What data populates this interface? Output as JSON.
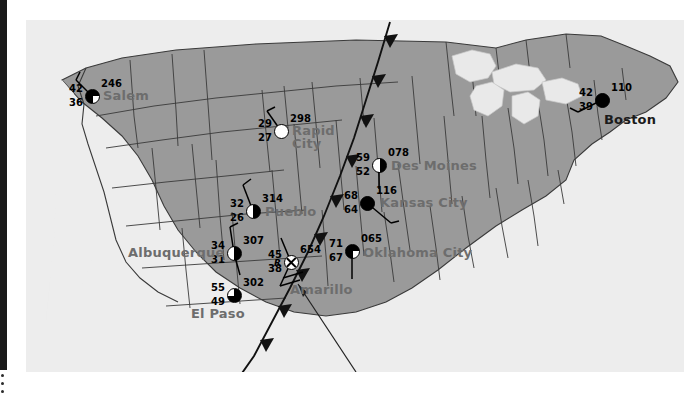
{
  "map": {
    "title": "US Surface Station Plot Map",
    "colors": {
      "land": "#9a9a9a",
      "water": "#e4e4e4",
      "ocean": "#ededed",
      "border": "#3a3a3a",
      "front_line": "#111111",
      "label_gray": "#6d6d6d",
      "label_dark": "#1b1b1b",
      "page_background": "#ffffff",
      "edge_bar": "#1a1a1a"
    },
    "front": {
      "type": "cold-front",
      "symbol": "triangle-barbs",
      "count": 9
    },
    "pointer": {
      "name": "callout-leader-line",
      "direction": "up-left",
      "target": "Amarillo"
    }
  },
  "stations": [
    {
      "id": "salem",
      "city": "Salem",
      "label_color": "gray",
      "temperature": "42",
      "dewpoint": "36",
      "pressure": "246",
      "sky_cover": "three-q",
      "sky_cover_name": "broken-clouds",
      "wind": {
        "has_barb": true,
        "direction_deg": 315,
        "barbs": 1
      },
      "x": 92,
      "y": 96,
      "city_x": 103,
      "city_y": 89
    },
    {
      "id": "rapid-city",
      "city": "Rapid City",
      "city_line1": "Rapid",
      "city_line2": "City",
      "label_color": "gray",
      "temperature": "29",
      "dewpoint": "27",
      "pressure": "298",
      "sky_cover": "clear",
      "sky_cover_name": "clear-sky",
      "wind": {
        "has_barb": true,
        "direction_deg": 340,
        "barbs": 1
      },
      "x": 281,
      "y": 131,
      "city_x": 292,
      "city_y": 124
    },
    {
      "id": "boston",
      "city": "Boston",
      "label_color": "dark",
      "temperature": "42",
      "dewpoint": "39",
      "pressure": "110",
      "sky_cover": "overcast",
      "sky_cover_name": "overcast",
      "wind": {
        "has_barb": true,
        "direction_deg": 215,
        "barbs": 2
      },
      "x": 602,
      "y": 100,
      "city_x": 604,
      "city_y": 113
    },
    {
      "id": "des-moines",
      "city": "Des Moines",
      "label_color": "gray",
      "temperature": "59",
      "dewpoint": "52",
      "pressure": "078",
      "sky_cover": "half",
      "sky_cover_name": "scattered-clouds",
      "wind": {
        "has_barb": true,
        "direction_deg": 180,
        "barbs": 1
      },
      "x": 379,
      "y": 165,
      "city_x": 391,
      "city_y": 159
    },
    {
      "id": "kansas-city",
      "city": "Kansas City",
      "label_color": "gray",
      "temperature": "68",
      "dewpoint": "64",
      "pressure": "116",
      "sky_cover": "overcast",
      "sky_cover_name": "overcast",
      "wind": {
        "has_barb": true,
        "direction_deg": 150,
        "barbs": 1
      },
      "x": 367,
      "y": 203,
      "city_x": 380,
      "city_y": 196
    },
    {
      "id": "pueblo",
      "city": "Pueblo",
      "label_color": "gray",
      "temperature": "32",
      "dewpoint": "26",
      "pressure": "314",
      "sky_cover": "half",
      "sky_cover_name": "scattered-clouds",
      "wind": {
        "has_barb": true,
        "direction_deg": 340,
        "barbs": 1
      },
      "x": 253,
      "y": 211,
      "city_x": 265,
      "city_y": 205
    },
    {
      "id": "albuquerque",
      "city": "Albuquerque",
      "label_color": "gray",
      "temperature": "34",
      "dewpoint": "31",
      "pressure": "307",
      "sky_cover": "half",
      "sky_cover_name": "scattered-clouds",
      "wind": {
        "has_barb": true,
        "direction_deg": 10,
        "barbs": 1
      },
      "x": 234,
      "y": 253,
      "city_x": 128,
      "city_y": 246
    },
    {
      "id": "amarillo",
      "city": "Amarillo",
      "label_color": "gray",
      "temperature": "45",
      "dewpoint": "38",
      "pressure": "654",
      "weather_symbol": "R",
      "weather_name": "rain",
      "sky_cover": "obscured",
      "sky_cover_name": "sky-obscured",
      "wind": {
        "has_barb": true,
        "direction_deg": 200,
        "barbs": 2
      },
      "x": 291,
      "y": 262,
      "city_x": 290,
      "city_y": 283
    },
    {
      "id": "oklahoma-city",
      "city": "Oklahoma City",
      "label_color": "gray",
      "temperature": "71",
      "dewpoint": "67",
      "pressure": "065",
      "sky_cover": "three-q",
      "sky_cover_name": "broken-clouds",
      "wind": {
        "has_barb": true,
        "direction_deg": 180,
        "barbs": 1
      },
      "x": 352,
      "y": 251,
      "city_x": 363,
      "city_y": 246
    },
    {
      "id": "el-paso",
      "city": "El Paso",
      "label_color": "gray",
      "temperature": "55",
      "dewpoint": "49",
      "pressure": "302",
      "sky_cover": "quarter",
      "sky_cover_name": "few-clouds",
      "wind": {
        "has_barb": false,
        "direction_deg": 0,
        "barbs": 0
      },
      "x": 234,
      "y": 295,
      "city_x": 191,
      "city_y": 307
    }
  ]
}
